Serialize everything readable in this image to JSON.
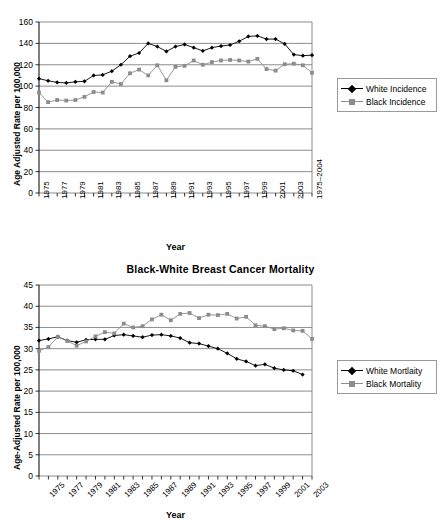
{
  "page": {
    "background": "#ffffff",
    "width": 441,
    "height": 523
  },
  "charts": [
    {
      "id": "incidence",
      "title": "",
      "xlabel": "Year",
      "ylabel": "Age Adjusted Rate per 100,000"
    },
    {
      "id": "mortality",
      "title": "Black-White Breast Cancer Mortality",
      "xlabel": "Year",
      "ylabel": "Age-Adjusted Rate per 100,000"
    }
  ],
  "chart_data": [
    {
      "type": "line",
      "id": "incidence",
      "title": "",
      "xlabel": "Year",
      "ylabel": "Age Adjusted Rate per 100,000",
      "ylim": [
        0,
        160
      ],
      "yticks": [
        0,
        20,
        40,
        60,
        80,
        100,
        120,
        140,
        160
      ],
      "grid": true,
      "legend_position": "right",
      "x": [
        1975,
        1976,
        1977,
        1978,
        1979,
        1980,
        1981,
        1982,
        1983,
        1984,
        1985,
        1986,
        1987,
        1988,
        1989,
        1990,
        1991,
        1992,
        1993,
        1994,
        1995,
        1996,
        1997,
        1998,
        1999,
        2000,
        2001,
        2002,
        2003,
        2004
      ],
      "xtick_labels": [
        "1975",
        "",
        "1977",
        "",
        "1979",
        "",
        "1981",
        "",
        "1983",
        "",
        "1985",
        "",
        "1987",
        "",
        "1989",
        "",
        "1991",
        "",
        "1993",
        "",
        "1995",
        "",
        "1997",
        "",
        "1999",
        "",
        "2001",
        "",
        "2003",
        "",
        "1975–2004"
      ],
      "series": [
        {
          "name": "White Incidence",
          "marker": "diamond",
          "color": "#000000",
          "values": [
            107,
            105,
            103.5,
            103,
            104,
            104.5,
            110,
            110.5,
            114,
            120,
            128,
            131,
            140,
            137,
            132.5,
            137,
            139,
            136,
            133,
            136,
            137.5,
            138.5,
            142,
            146.5,
            147,
            144,
            144,
            139.5,
            129.5,
            128.5,
            129
          ]
        },
        {
          "name": "Black Incidence",
          "marker": "square",
          "color": "#8c8c8c",
          "values": [
            94,
            85,
            87,
            86.5,
            87,
            90,
            94.5,
            94,
            104,
            102,
            112,
            115.5,
            110,
            119.5,
            105.5,
            118,
            119,
            124,
            120,
            122.5,
            124,
            124.5,
            124,
            123,
            125.5,
            116,
            114.5,
            120.5,
            121,
            119.5,
            112.5
          ]
        }
      ]
    },
    {
      "type": "line",
      "id": "mortality",
      "title": "Black-White Breast Cancer Mortality",
      "xlabel": "Year",
      "ylabel": "Age-Adjusted Rate per 100,000",
      "ylim": [
        0,
        45
      ],
      "yticks": [
        0,
        5,
        10,
        15,
        20,
        25,
        30,
        35,
        40,
        45
      ],
      "grid": true,
      "legend_position": "right",
      "x": [
        1975,
        1976,
        1977,
        1978,
        1979,
        1980,
        1981,
        1982,
        1983,
        1984,
        1985,
        1986,
        1987,
        1988,
        1989,
        1990,
        1991,
        1992,
        1993,
        1994,
        1995,
        1996,
        1997,
        1998,
        1999,
        2000,
        2001,
        2002,
        2003,
        2004
      ],
      "xtick_labels": [
        "1975",
        "",
        "1977",
        "",
        "1979",
        "",
        "1981",
        "",
        "1983",
        "",
        "1985",
        "",
        "1987",
        "",
        "1989",
        "",
        "1991",
        "",
        "1993",
        "",
        "1995",
        "",
        "1997",
        "",
        "1999",
        "",
        "2001",
        "",
        "2003",
        ""
      ],
      "series": [
        {
          "name": "White Mortlaity",
          "marker": "diamond",
          "color": "#000000",
          "values": [
            31.9,
            32.3,
            32.8,
            31.9,
            31.5,
            32.1,
            32.2,
            32.2,
            33.1,
            33.3,
            33.0,
            32.7,
            33.2,
            33.3,
            33.0,
            32.5,
            31.4,
            31.2,
            30.6,
            30.0,
            28.9,
            27.6,
            27.0,
            26.0,
            26.3,
            25.4,
            25.0,
            24.8,
            23.9
          ]
        },
        {
          "name": "Black Mortality",
          "marker": "square",
          "color": "#8c8c8c",
          "values": [
            29.5,
            30.4,
            32.8,
            31.8,
            30.7,
            31.7,
            32.9,
            33.9,
            33.6,
            35.9,
            35.0,
            35.3,
            36.9,
            38.0,
            36.7,
            38.2,
            38.4,
            37.2,
            38.0,
            37.9,
            38.2,
            37.1,
            37.5,
            35.5,
            35.3,
            34.6,
            34.8,
            34.3,
            34.2,
            32.3
          ]
        }
      ]
    }
  ],
  "legends": [
    {
      "chart": "incidence",
      "items": [
        {
          "label": "White Incidence",
          "marker": "diamond",
          "color": "#000000"
        },
        {
          "label": "Black Incidence",
          "marker": "square",
          "color": "#8c8c8c"
        }
      ]
    },
    {
      "chart": "mortality",
      "items": [
        {
          "label": "White Mortlaity",
          "marker": "diamond",
          "color": "#000000"
        },
        {
          "label": "Black Mortality",
          "marker": "square",
          "color": "#8c8c8c"
        }
      ]
    }
  ]
}
